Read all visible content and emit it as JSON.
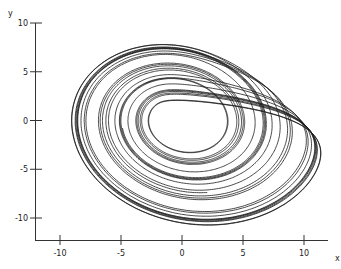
{
  "chart_data": {
    "type": "line",
    "title": "",
    "xlabel": "x",
    "ylabel": "y",
    "xlim": [
      -12.0,
      12.3
    ],
    "ylim": [
      -12.4,
      10.0
    ],
    "x_ticks": [
      -10,
      -5,
      0,
      5,
      10
    ],
    "y_ticks": [
      10,
      5,
      0,
      -5,
      -10
    ],
    "x_tick_labels": [
      "-10",
      "-5",
      "0",
      "5",
      "10"
    ],
    "y_tick_labels": [
      "10",
      "5",
      "0",
      "-5",
      "-10"
    ],
    "grid": false,
    "legend": null,
    "line_color": "#1a1a1a",
    "series": [
      {
        "name": "trajectory",
        "generator": "rossler",
        "params": {
          "a": 0.2,
          "b": 0.2,
          "c": 5.7
        },
        "initial": [
          1.0,
          1.0,
          0.0
        ],
        "dt": 0.01,
        "transient_steps": 5000,
        "steps": 16000,
        "x_range": [
          -9.5,
          11.3
        ],
        "y_range": [
          -10.9,
          8.0
        ]
      }
    ]
  }
}
